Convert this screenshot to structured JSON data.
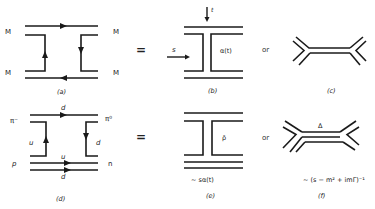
{
  "figure": {
    "panels": [
      {
        "id": "a",
        "caption": "(a)",
        "labels": {
          "left_top": "M",
          "left_bottom": "M",
          "right_top": "M",
          "right_bottom": "M"
        }
      },
      {
        "id": "b",
        "caption": "(b)",
        "labels": {
          "t": "t",
          "s": "s",
          "trajectory": "α(t)"
        }
      },
      {
        "id": "c",
        "caption": "(c)"
      },
      {
        "id": "d",
        "caption": "(d)",
        "labels": {
          "pi_minus": "π⁻",
          "pi_zero": "π⁰",
          "p": "p",
          "n": "n",
          "top_quark": "d",
          "left_quark": "u",
          "right_quark": "d",
          "mid_quark": "u",
          "bottom_quark": "d"
        }
      },
      {
        "id": "e",
        "caption": "(e)",
        "labels": {
          "exchange": "ρ̄",
          "amplitude": "~ sα(t)"
        }
      },
      {
        "id": "f",
        "caption": "(f)",
        "labels": {
          "resonance": "Δ",
          "amplitude": "~ (s − m² + imΓ)⁻¹"
        }
      }
    ],
    "connectors": {
      "equals": "=",
      "or": "or"
    }
  }
}
